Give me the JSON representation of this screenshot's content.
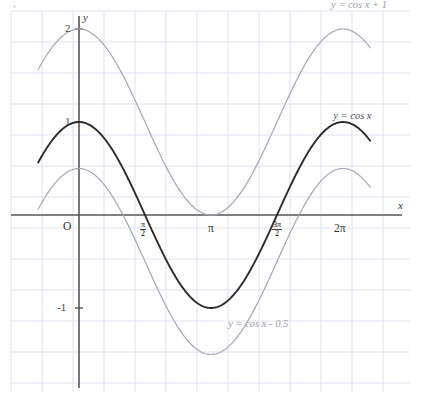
{
  "figure": {
    "axis_x_label": "x",
    "axis_y_label": "y",
    "origin_label": "O"
  },
  "colors": {
    "grid": "#dfe3ef",
    "axis": "#555555",
    "curve_main": "#2b2b2b",
    "curve_shifted": "#a6a6b4",
    "background": "#ffffff",
    "text": "#333333"
  },
  "ticks": {
    "y": [
      {
        "label": "2",
        "value": 2
      },
      {
        "label": "1",
        "value": 1
      },
      {
        "label": "-1",
        "value": -1
      }
    ],
    "x": [
      {
        "label": "π",
        "value": 3.14159,
        "kind": "plain"
      },
      {
        "label": "2π",
        "value": 6.28319,
        "kind": "plain"
      },
      {
        "num": "π",
        "den": "2",
        "value": 1.5708,
        "kind": "fraction"
      },
      {
        "num": "3π",
        "den": "2",
        "value": 4.71239,
        "kind": "fraction"
      }
    ]
  },
  "chart_data": {
    "type": "line",
    "title": "",
    "xlabel": "x",
    "ylabel": "y",
    "xlim": [
      -0.97,
      6.93
    ],
    "ylim": [
      -2.05,
      2.35
    ],
    "grid": true,
    "grid_spacing": {
      "x": 0.7,
      "y": 0.333
    },
    "legend": "inline-annotations",
    "x_tick_labels": [
      "O",
      "π/2",
      "π",
      "3π/2",
      "2π"
    ],
    "y_tick_labels": [
      "2",
      "1",
      "-1"
    ],
    "series": [
      {
        "name": "y = cos x + 1",
        "expression": "cos(x) + 1",
        "amplitude": 1,
        "vertical_shift": 1,
        "color": "#a6a6b4",
        "width": 1.2,
        "label_x": 6.0,
        "label_y": 2.25,
        "key_points": [
          {
            "x": 0,
            "y": 2
          },
          {
            "x": 1.5708,
            "y": 1
          },
          {
            "x": 3.14159,
            "y": 0
          },
          {
            "x": 4.71239,
            "y": 1
          },
          {
            "x": 6.28319,
            "y": 2
          }
        ]
      },
      {
        "name": "y = cos x",
        "expression": "cos(x)",
        "amplitude": 1,
        "vertical_shift": 0,
        "color": "#2b2b2b",
        "width": 1.9,
        "label_x": 6.05,
        "label_y": 1.05,
        "key_points": [
          {
            "x": 0,
            "y": 1
          },
          {
            "x": 1.5708,
            "y": 0
          },
          {
            "x": 3.14159,
            "y": -1
          },
          {
            "x": 4.71239,
            "y": 0
          },
          {
            "x": 6.28319,
            "y": 1
          }
        ]
      },
      {
        "name": "y = cos x - 0.5",
        "expression": "cos(x) - 0.5",
        "amplitude": 1,
        "vertical_shift": -0.5,
        "color": "#a6a6b4",
        "width": 1.2,
        "label_x": 3.55,
        "label_y": -1.18,
        "key_points": [
          {
            "x": 0,
            "y": 0.5
          },
          {
            "x": 1.5708,
            "y": -0.5
          },
          {
            "x": 3.14159,
            "y": -1.5
          },
          {
            "x": 4.71239,
            "y": -0.5
          },
          {
            "x": 6.28319,
            "y": 0.5
          }
        ]
      }
    ]
  }
}
